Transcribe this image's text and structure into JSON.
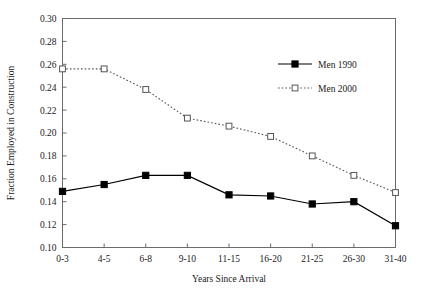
{
  "chart_data": {
    "type": "line",
    "title": "",
    "subtitle": "",
    "xlabel": "Years Since Arrival",
    "ylabel": "Fraction Employed in Construction",
    "categories": [
      "0-3",
      "4-5",
      "6-8",
      "9-10",
      "11-15",
      "16-20",
      "21-25",
      "26-30",
      "31-40"
    ],
    "ylim": [
      0.1,
      0.3
    ],
    "ytick_labels": [
      "0.10",
      "0.12",
      "0.14",
      "0.16",
      "0.18",
      "0.20",
      "0.22",
      "0.24",
      "0.26",
      "0.28",
      "0.30"
    ],
    "ytick_values": [
      0.1,
      0.12,
      0.14,
      0.16,
      0.18,
      0.2,
      0.22,
      0.24,
      0.26,
      0.28,
      0.3
    ],
    "grid": false,
    "legend_position": "upper right",
    "series": [
      {
        "name": "Men 1990",
        "marker": "filled-square",
        "line_style": "solid",
        "color": "#000000",
        "values": [
          0.149,
          0.155,
          0.163,
          0.163,
          0.146,
          0.145,
          0.138,
          0.14,
          0.119
        ]
      },
      {
        "name": "Men 2000",
        "marker": "open-square",
        "line_style": "dotted",
        "color": "#555555",
        "values": [
          0.256,
          0.256,
          0.238,
          0.213,
          0.206,
          0.197,
          0.18,
          0.163,
          0.148
        ]
      }
    ]
  },
  "legend": {
    "entries": [
      {
        "label": "Men 1990"
      },
      {
        "label": "Men 2000"
      }
    ]
  },
  "axes": {
    "x_title": "Years Since Arrival",
    "y_title": "Fraction Employed in Construction"
  }
}
